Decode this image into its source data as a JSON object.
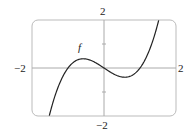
{
  "chart_data": {
    "type": "line",
    "title": "",
    "xlabel": "",
    "ylabel": "",
    "xlim": [
      -2,
      2
    ],
    "ylim": [
      -2,
      2
    ],
    "grid": false,
    "series": [
      {
        "name": "f",
        "function": "x^3 - x",
        "x": [
          -1.5,
          -1.25,
          -1.0,
          -0.75,
          -0.577,
          -0.25,
          0,
          0.25,
          0.577,
          0.75,
          1.0,
          1.25,
          1.52
        ],
        "values": [
          -1.875,
          -0.703,
          0,
          0.328,
          0.385,
          0.234,
          0,
          -0.234,
          -0.385,
          -0.328,
          0,
          0.703,
          2.0
        ]
      }
    ],
    "tick_labels": {
      "x_left": "−2",
      "x_right": "2",
      "y_top": "2",
      "y_bottom": "−2"
    },
    "annotations": [
      {
        "text": "f",
        "x": -0.75,
        "y": 0.9
      }
    ]
  },
  "labels": {
    "x_min": "−2",
    "x_max": "2",
    "y_max": "2",
    "y_min": "−2",
    "curve": "f"
  }
}
